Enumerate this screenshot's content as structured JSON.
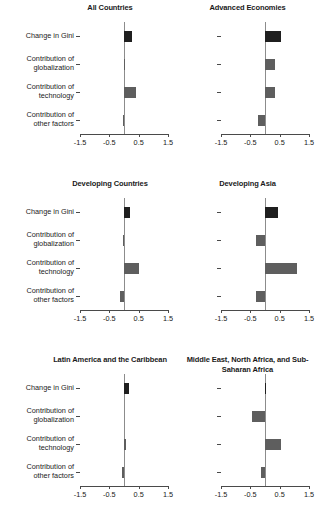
{
  "chart_data": {
    "type": "bar",
    "orientation": "horizontal",
    "title": "",
    "xlabel": "",
    "ylabel": "",
    "xlim": [
      -1.5,
      1.5
    ],
    "xticks": [
      -1.5,
      -0.5,
      0.5,
      1.5
    ],
    "xticklabels": [
      "-1.5",
      "-0.5",
      "0.5",
      "1.5"
    ],
    "grid": false,
    "legend": "none",
    "categories": [
      "Change in Gini",
      "Contribution of\nglobalization",
      "Contribution of\ntechnology",
      "Contribution of\nother factors"
    ],
    "colors": {
      "change_in_gini": "#1f1f1f",
      "contribution": "#5e5e5e",
      "axis": "#4a4a4a",
      "zero_line": "#8c8c8c"
    },
    "panels": [
      {
        "title": "All Countries",
        "values": [
          0.28,
          0.03,
          0.4,
          -0.02
        ]
      },
      {
        "title": "Advanced Economies",
        "values": [
          0.55,
          0.35,
          0.35,
          -0.25
        ]
      },
      {
        "title": "Developing Countries",
        "values": [
          0.22,
          -0.03,
          0.5,
          -0.12
        ]
      },
      {
        "title": "Developing Asia",
        "values": [
          0.45,
          -0.3,
          1.1,
          -0.3
        ]
      },
      {
        "title": "Latin America and the\nCaribbean",
        "values": [
          0.18,
          0.0,
          0.08,
          -0.07
        ]
      },
      {
        "title": "Middle East, North Africa,\nand Sub-Saharan Africa",
        "values": [
          0.02,
          -0.45,
          0.55,
          -0.13
        ]
      }
    ]
  }
}
